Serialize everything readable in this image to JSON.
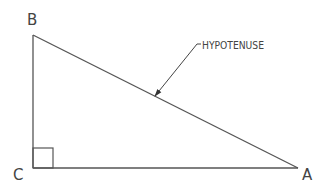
{
  "diagram": {
    "vertices": {
      "A": {
        "label": "A",
        "x": 298,
        "y": 168
      },
      "B": {
        "label": "B",
        "x": 33,
        "y": 35
      },
      "C": {
        "label": "C",
        "x": 33,
        "y": 168
      }
    },
    "annotation": {
      "text": "HYPOTENUSE",
      "leader_start": {
        "x": 201,
        "y": 44
      },
      "leader_elbow": {
        "x": 197,
        "y": 44
      },
      "arrow_tip": {
        "x": 155,
        "y": 96
      }
    },
    "right_angle_marker_size": 20,
    "colors": {
      "line": "#555555",
      "text": "#444444",
      "background": "#ffffff"
    }
  }
}
